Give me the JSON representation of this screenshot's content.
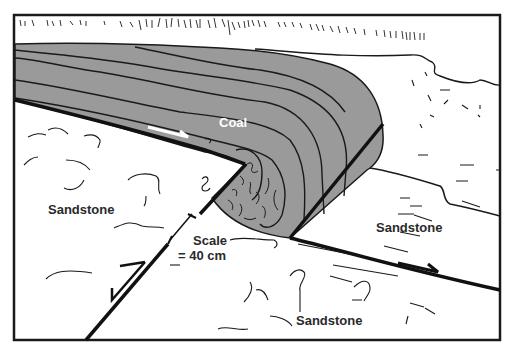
{
  "diagram": {
    "type": "geologic cross-section",
    "labels": {
      "coal": "Coal",
      "sandstone_left": "Sandstone",
      "sandstone_right": "Sandstone",
      "sandstone_bottom": "Sandstone",
      "scale_line1": "Scale",
      "scale_line2": "= 40 cm"
    },
    "colors": {
      "coal_fill": "#9a9a9a",
      "line": "#1a1a1a",
      "background": "#ffffff",
      "arrow_on_coal": "#ffffff"
    }
  }
}
